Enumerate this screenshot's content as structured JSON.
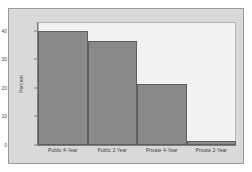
{
  "chart_data": {
    "type": "bar",
    "title": "",
    "xlabel": "",
    "ylabel": "Percent",
    "categories": [
      "Public 4-Year",
      "Public 2-Year",
      "Private 4-Year",
      "Private 2-Year"
    ],
    "values": [
      40,
      36.5,
      21.5,
      1.5
    ],
    "ylim": [
      0,
      43
    ],
    "yticks": [
      0,
      10,
      20,
      30,
      40
    ],
    "ytick_labels": [
      "0",
      "10",
      "20",
      "30",
      "40"
    ],
    "grid": false,
    "legend": null,
    "bar_color": "#898989",
    "bar_border_color": "#5e5e5e",
    "panel_color": "#f2f2f2",
    "frame_color": "#d9d9d9",
    "axis_color": "#7d7d7d"
  },
  "figure": {
    "background": "#ffffff"
  }
}
